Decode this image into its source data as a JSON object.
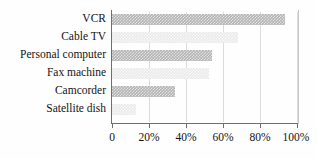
{
  "chart_data": {
    "type": "bar",
    "orientation": "horizontal",
    "title": "",
    "xlabel": "",
    "ylabel": "",
    "categories": [
      "VCR",
      "Cable TV",
      "Personal computer",
      "Fax machine",
      "Camcorder",
      "Satellite dish"
    ],
    "values": [
      93,
      68,
      54,
      52,
      34,
      13
    ],
    "xlim": [
      0,
      100
    ],
    "xticks": [
      0,
      20,
      40,
      60,
      80,
      100
    ],
    "xtick_labels": [
      "0",
      "20%",
      "40%",
      "60%",
      "80%",
      "100%"
    ],
    "grid": true,
    "grid_axis": "x",
    "legend": false,
    "bar_styles": [
      "dark",
      "light",
      "dark",
      "light",
      "dark",
      "light"
    ],
    "colors": {
      "bar_dark": "#b4b4b4",
      "bar_light": "#e9e9e9",
      "axis": "#6e6e6e",
      "grid": "#dcdcdc",
      "text": "#141414",
      "background": "#fefefe"
    }
  }
}
